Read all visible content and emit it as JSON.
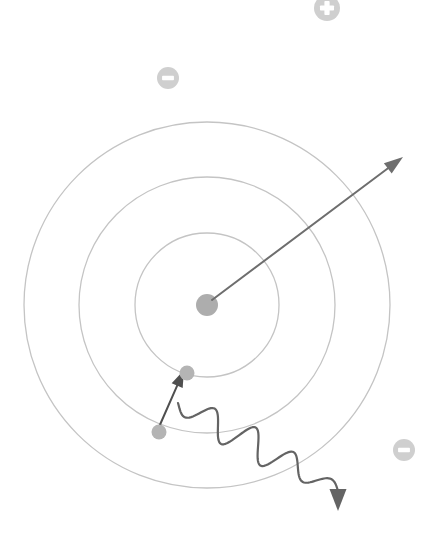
{
  "diagram": {
    "canvas": {
      "width": 446,
      "height": 554,
      "background": "#ffffff"
    },
    "nucleus": {
      "label": "nucleus",
      "cx": 207,
      "cy": 305,
      "r": 11,
      "color": "#adadad"
    },
    "orbits": [
      {
        "name": "inner-orbit",
        "shell": "n=1",
        "cx": 207,
        "cy": 305,
        "r": 72,
        "color": "#c4c4c4"
      },
      {
        "name": "middle-orbit",
        "shell": "n=2",
        "cx": 207,
        "cy": 305,
        "r": 128,
        "color": "#c4c4c4"
      },
      {
        "name": "outer-orbit",
        "shell": "n=3",
        "cx": 207,
        "cy": 305,
        "r": 183,
        "color": "#c4c4c4"
      }
    ],
    "electrons": [
      {
        "name": "electron-inner",
        "cx": 187,
        "cy": 373,
        "r": 7.5,
        "color": "#b4b4b4",
        "on_orbit": "inner-orbit"
      },
      {
        "name": "electron-middle",
        "cx": 159,
        "cy": 432,
        "r": 7.5,
        "color": "#b4b4b4",
        "on_orbit": "middle-orbit"
      }
    ],
    "charge_badges": [
      {
        "name": "positive-charge",
        "sign": "+",
        "cx": 327,
        "cy": 8,
        "r": 13,
        "color": "#cfcfcf",
        "glyph_color": "#ffffff"
      },
      {
        "name": "negative-charge-upper",
        "sign": "−",
        "cx": 168,
        "cy": 78,
        "r": 11,
        "color": "#cfcfcf",
        "glyph_color": "#ffffff"
      },
      {
        "name": "negative-charge-lower",
        "sign": "−",
        "cx": 404,
        "cy": 450,
        "r": 11,
        "color": "#cfcfcf",
        "glyph_color": "#ffffff"
      }
    ],
    "radius_vector": {
      "name": "nucleus-radius-vector",
      "from": {
        "x": 212,
        "y": 300
      },
      "to": {
        "x": 403,
        "y": 157
      },
      "color": "#6e6e6e"
    },
    "transition_arrow": {
      "name": "electron-jump-arrow",
      "from": {
        "x": 159,
        "y": 427
      },
      "to": {
        "x": 184,
        "y": 370
      },
      "color": "#4f4f4f",
      "meaning": "electron jumps to lower shell"
    },
    "photon": {
      "name": "emitted-photon-wave",
      "start": {
        "x": 178,
        "y": 403
      },
      "end": {
        "x": 338,
        "y": 511
      },
      "color": "#646464",
      "waves": 4,
      "meaning": "photon emitted during transition"
    }
  }
}
